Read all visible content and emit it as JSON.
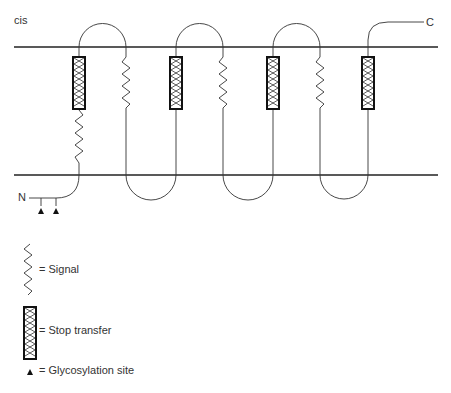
{
  "diagram": {
    "side_label": "cis",
    "n_terminus": "N",
    "c_terminus": "C"
  },
  "legend": {
    "signal": "= Signal",
    "stop_transfer": "= Stop transfer",
    "glycosylation": "= Glycosylation site"
  },
  "colors": {
    "line": "#333333",
    "membrane": "#222222"
  }
}
